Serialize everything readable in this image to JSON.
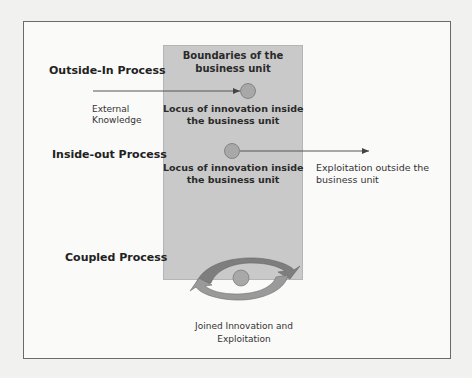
{
  "diagram": {
    "business_unit": {
      "title_line1": "Boundaries of the",
      "title_line2": "business unit",
      "fill": "#c9c9c9"
    },
    "processes": [
      {
        "name": "Outside-In Process",
        "input_label_line1": "External",
        "input_label_line2": "Knowledge",
        "locus_line1": "Locus of innovation inside",
        "locus_line2": "the business unit",
        "arrow": "inbound"
      },
      {
        "name": "Inside-out Process",
        "locus_line1": "Locus of innovation inside",
        "locus_line2": "the business unit",
        "output_label_line1": "Exploitation outside the",
        "output_label_line2": "business unit",
        "arrow": "outbound"
      },
      {
        "name": "Coupled Process",
        "caption_line1": "Joined Innovation and",
        "caption_line2": "Exploitation",
        "icon": "cycle-arrows-icon"
      }
    ],
    "colors": {
      "circle": "#a8a8a8",
      "arrow": "#555555",
      "cycle_dark": "#7a7a7a",
      "cycle_light": "#999999",
      "frame": "#6a6a6a"
    }
  }
}
